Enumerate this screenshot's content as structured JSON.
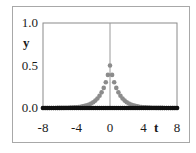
{
  "chart_data": {
    "type": "scatter",
    "title": "",
    "xlabel": "t",
    "ylabel": "y",
    "xlim": [
      -8,
      8
    ],
    "ylim": [
      0,
      1
    ],
    "x_ticks": [
      -8,
      -4,
      0,
      4,
      8
    ],
    "x_tick_labels": [
      "-8",
      "-4",
      "0",
      "4",
      "8"
    ],
    "y_ticks": [
      0,
      0.5,
      1
    ],
    "y_tick_labels": [
      "0.0",
      "0.5",
      "1.0"
    ],
    "grid": false,
    "legend": null,
    "series": [
      {
        "name": "peaked curve (≈0.5·e^(-|t|))",
        "color": "#8c8c8c",
        "x_start": -8,
        "x_end": 8,
        "x_step": 0.25,
        "formula": "0.5*exp(-|t|)"
      },
      {
        "name": "zero baseline",
        "color": "#111111",
        "x_start": -8,
        "x_end": 8,
        "x_step": 0.25,
        "formula": "0"
      }
    ]
  },
  "colors": {
    "frame": "#a8a8a8",
    "plot_border": "#8a8a8a",
    "zero_line": "#9a9a9a"
  }
}
